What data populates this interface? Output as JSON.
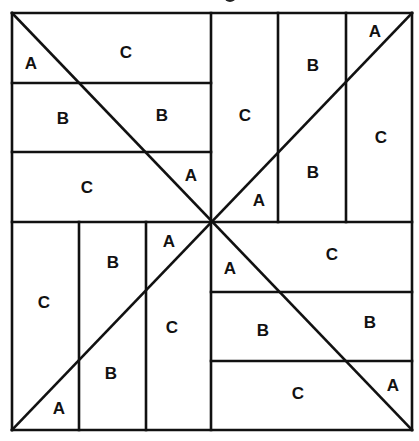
{
  "diagram": {
    "type": "quilt-block",
    "stroke_color": "#111111",
    "background": "#ffffff",
    "outer_square": {
      "x1": 12,
      "y1": 13,
      "x2": 412,
      "y2": 430
    },
    "center": {
      "x": 211,
      "y": 222
    },
    "lines": [
      {
        "id": "outer-top",
        "x1": 12,
        "y1": 13,
        "x2": 412,
        "y2": 13
      },
      {
        "id": "outer-bottom",
        "x1": 12,
        "y1": 430,
        "x2": 412,
        "y2": 430
      },
      {
        "id": "outer-left",
        "x1": 12,
        "y1": 13,
        "x2": 12,
        "y2": 430
      },
      {
        "id": "outer-right",
        "x1": 412,
        "y1": 13,
        "x2": 412,
        "y2": 430
      },
      {
        "id": "mid-vertical",
        "x1": 211,
        "y1": 13,
        "x2": 211,
        "y2": 430
      },
      {
        "id": "mid-horizontal",
        "x1": 12,
        "y1": 222,
        "x2": 412,
        "y2": 222
      },
      {
        "id": "diag-main",
        "x1": 12,
        "y1": 13,
        "x2": 412,
        "y2": 430
      },
      {
        "id": "diag-anti",
        "x1": 412,
        "y1": 13,
        "x2": 12,
        "y2": 430
      },
      {
        "id": "tl-h1",
        "x1": 12,
        "y1": 83,
        "x2": 211,
        "y2": 83
      },
      {
        "id": "tl-h2",
        "x1": 12,
        "y1": 152,
        "x2": 211,
        "y2": 152
      },
      {
        "id": "tr-v1",
        "x1": 278,
        "y1": 13,
        "x2": 278,
        "y2": 222
      },
      {
        "id": "tr-v2",
        "x1": 346,
        "y1": 13,
        "x2": 346,
        "y2": 222
      },
      {
        "id": "bl-v1",
        "x1": 79,
        "y1": 222,
        "x2": 79,
        "y2": 430
      },
      {
        "id": "bl-v2",
        "x1": 146,
        "y1": 222,
        "x2": 146,
        "y2": 430
      },
      {
        "id": "br-h1",
        "x1": 211,
        "y1": 292,
        "x2": 412,
        "y2": 292
      },
      {
        "id": "br-h2",
        "x1": 211,
        "y1": 361,
        "x2": 412,
        "y2": 361
      }
    ],
    "labels": [
      {
        "text": "A",
        "x": 31,
        "y": 63
      },
      {
        "text": "C",
        "x": 126,
        "y": 52
      },
      {
        "text": "B",
        "x": 63,
        "y": 118
      },
      {
        "text": "B",
        "x": 162,
        "y": 115
      },
      {
        "text": "C",
        "x": 87,
        "y": 187
      },
      {
        "text": "A",
        "x": 191,
        "y": 175
      },
      {
        "text": "C",
        "x": 245,
        "y": 115
      },
      {
        "text": "B",
        "x": 313,
        "y": 65
      },
      {
        "text": "A",
        "x": 375,
        "y": 31
      },
      {
        "text": "C",
        "x": 381,
        "y": 137
      },
      {
        "text": "B",
        "x": 313,
        "y": 172
      },
      {
        "text": "A",
        "x": 259,
        "y": 200
      },
      {
        "text": "C",
        "x": 44,
        "y": 302
      },
      {
        "text": "B",
        "x": 113,
        "y": 262
      },
      {
        "text": "A",
        "x": 169,
        "y": 241
      },
      {
        "text": "C",
        "x": 172,
        "y": 327
      },
      {
        "text": "B",
        "x": 111,
        "y": 373
      },
      {
        "text": "A",
        "x": 59,
        "y": 408
      },
      {
        "text": "A",
        "x": 230,
        "y": 268
      },
      {
        "text": "C",
        "x": 332,
        "y": 254
      },
      {
        "text": "B",
        "x": 263,
        "y": 330
      },
      {
        "text": "B",
        "x": 370,
        "y": 322
      },
      {
        "text": "C",
        "x": 298,
        "y": 393
      },
      {
        "text": "A",
        "x": 393,
        "y": 385
      }
    ]
  }
}
